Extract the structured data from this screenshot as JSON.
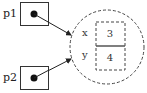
{
  "diagram": {
    "pointers": [
      {
        "name": "p1",
        "label": "p1"
      },
      {
        "name": "p2",
        "label": "p2"
      }
    ],
    "object": {
      "fields": [
        {
          "name": "x",
          "label": "x",
          "value": "3"
        },
        {
          "name": "y",
          "label": "y",
          "value": "4"
        }
      ]
    },
    "colors": {
      "stroke": "#333333",
      "background": "#ffffff"
    }
  }
}
